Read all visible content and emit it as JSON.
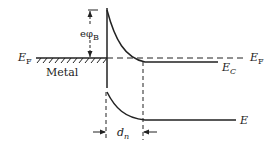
{
  "diagram": {
    "type": "band-diagram",
    "labels": {
      "ef_left": {
        "main": "E",
        "sub": "F"
      },
      "metal": "Metal",
      "barrier": {
        "main": "eφ",
        "sub": "B"
      },
      "ef_right": {
        "main": "E",
        "sub": "F"
      },
      "ec": {
        "main": "E",
        "sub": "C"
      },
      "ev": {
        "main": "E",
        "sub": ""
      },
      "depletion_width": {
        "main": "d",
        "sub": "n"
      }
    },
    "colors": {
      "line": "#222222",
      "background": "#ffffff"
    }
  }
}
